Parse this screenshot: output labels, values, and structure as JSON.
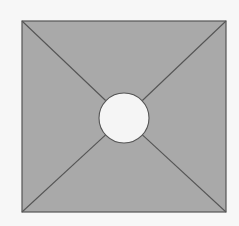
{
  "diagram": {
    "type": "square-with-diagonals-and-center-circle",
    "colors": {
      "background": "#f7f7f7",
      "square_fill": "#a9a9a9",
      "stroke": "#555555",
      "circle_fill": "#f5f5f5"
    },
    "square": {
      "x": 22,
      "y": 21,
      "width": 204,
      "height": 191
    },
    "circle": {
      "cx": 124,
      "cy": 118,
      "r": 25
    }
  }
}
